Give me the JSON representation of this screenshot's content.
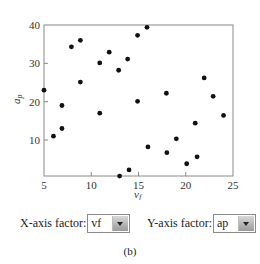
{
  "chart_data": {
    "type": "scatter",
    "title": "",
    "xlabel": "v_f",
    "ylabel": "a_p",
    "xlim": [
      5,
      25
    ],
    "ylim": [
      0.5,
      40
    ],
    "xticks": [
      5,
      10,
      15,
      20,
      25
    ],
    "yticks": [
      10,
      20,
      30,
      40
    ],
    "grid": false,
    "legend": null,
    "points": [
      {
        "x": 5.0,
        "y": 23.0
      },
      {
        "x": 6.0,
        "y": 11.0
      },
      {
        "x": 6.9,
        "y": 13.0
      },
      {
        "x": 6.9,
        "y": 19.0
      },
      {
        "x": 7.9,
        "y": 34.3
      },
      {
        "x": 8.85,
        "y": 36.0
      },
      {
        "x": 8.85,
        "y": 25.1
      },
      {
        "x": 10.9,
        "y": 30.1
      },
      {
        "x": 10.9,
        "y": 17.0
      },
      {
        "x": 11.9,
        "y": 32.9
      },
      {
        "x": 12.9,
        "y": 28.2
      },
      {
        "x": 13.0,
        "y": 0.6
      },
      {
        "x": 13.85,
        "y": 31.1
      },
      {
        "x": 14.0,
        "y": 2.2
      },
      {
        "x": 14.9,
        "y": 37.3
      },
      {
        "x": 14.9,
        "y": 20.1
      },
      {
        "x": 15.9,
        "y": 39.4
      },
      {
        "x": 16.0,
        "y": 8.2
      },
      {
        "x": 17.95,
        "y": 22.2
      },
      {
        "x": 18.0,
        "y": 6.7
      },
      {
        "x": 19.0,
        "y": 10.3
      },
      {
        "x": 20.1,
        "y": 3.8
      },
      {
        "x": 21.0,
        "y": 14.4
      },
      {
        "x": 21.2,
        "y": 5.6
      },
      {
        "x": 21.95,
        "y": 26.2
      },
      {
        "x": 22.9,
        "y": 21.4
      },
      {
        "x": 24.0,
        "y": 16.4
      }
    ]
  },
  "axes": {
    "x_ticks": [
      "5",
      "10",
      "15",
      "20",
      "25"
    ],
    "y_ticks": [
      "10",
      "20",
      "30",
      "40"
    ],
    "x_title": "v",
    "x_title_sub": "f",
    "y_title": "a",
    "y_title_sub": "p"
  },
  "controls": {
    "x_axis_label": "X-axis factor:",
    "x_axis_value": "vf",
    "y_axis_label": "Y-axis factor:",
    "y_axis_value": "ap"
  },
  "caption": "(b)"
}
